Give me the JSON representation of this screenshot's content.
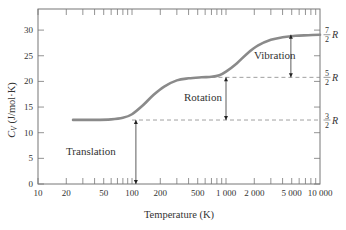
{
  "chart_data": {
    "type": "line",
    "title": "",
    "xlabel": "Temperature (K)",
    "ylabel": "C_V (J/mol·K)",
    "x_scale": "log",
    "xlim": [
      10,
      10000
    ],
    "ylim": [
      0,
      32
    ],
    "x_ticks": [
      10,
      20,
      50,
      100,
      200,
      500,
      1000,
      2000,
      5000,
      10000
    ],
    "x_tick_labels": [
      "10",
      "20",
      "50",
      "100",
      "200",
      "500",
      "1 000",
      "2 000",
      "5 000",
      "10 000"
    ],
    "y_ticks": [
      0,
      5,
      10,
      15,
      20,
      25,
      30
    ],
    "y_tick_labels": [
      "0",
      "5",
      "10",
      "15",
      "20",
      "25",
      "30"
    ],
    "grid": false,
    "series": [
      {
        "name": "C_V of H2",
        "color": "#8a8a8a",
        "x": [
          23.6,
          40,
          60,
          80,
          100,
          130,
          170,
          220,
          300,
          400,
          550,
          700,
          850,
          1000,
          1300,
          1700,
          2200,
          3000,
          4000,
          5500,
          7500,
          10000
        ],
        "y": [
          12.5,
          12.5,
          12.6,
          12.9,
          13.6,
          15.3,
          17.4,
          19.0,
          20.2,
          20.6,
          20.8,
          20.9,
          21.2,
          21.9,
          23.5,
          25.5,
          27.0,
          28.1,
          28.6,
          28.9,
          29.0,
          29.1
        ]
      }
    ],
    "reference_lines": [
      {
        "label_num": "3",
        "label_den": "2",
        "label": "3/2 R",
        "y": 12.47,
        "x_start": 100
      },
      {
        "label_num": "5",
        "label_den": "2",
        "label": "5/2 R",
        "y": 20.79,
        "x_start": 700
      },
      {
        "label_num": "7",
        "label_den": "2",
        "label": "7/2 R",
        "y": 29.1,
        "x_start": 10000
      }
    ],
    "annotations": [
      {
        "text": "Translation",
        "arrow_x": 110,
        "from_y": 0,
        "to_y": 12.47
      },
      {
        "text": "Rotation",
        "arrow_x": 1000,
        "from_y": 12.47,
        "to_y": 20.79
      },
      {
        "text": "Vibration",
        "arrow_x": 4900,
        "from_y": 20.79,
        "to_y": 29.1
      }
    ],
    "legend": null
  },
  "ui": {
    "xlabel": "Temperature (K)",
    "ylabel_main": "C",
    "ylabel_sub": "V",
    "ylabel_units": " (J/mol·K)",
    "ann_translation": "Translation",
    "ann_rotation": "Rotation",
    "ann_vibration": "Vibration",
    "R": "R"
  }
}
